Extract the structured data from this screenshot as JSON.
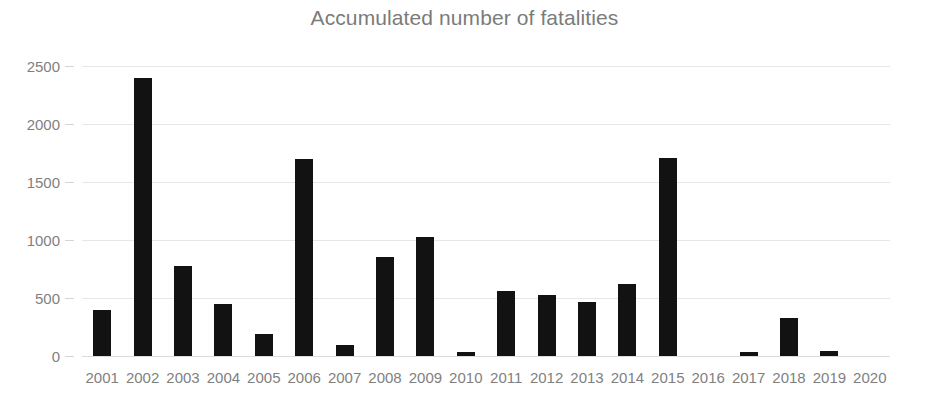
{
  "chart_data": {
    "type": "bar",
    "title": "Accumulated number of fatalities",
    "xlabel": "",
    "ylabel": "",
    "categories": [
      "2001",
      "2002",
      "2003",
      "2004",
      "2005",
      "2006",
      "2007",
      "2008",
      "2009",
      "2010",
      "2011",
      "2012",
      "2013",
      "2014",
      "2015",
      "2016",
      "2017",
      "2018",
      "2019",
      "2020"
    ],
    "values": [
      400,
      2400,
      780,
      450,
      190,
      1700,
      95,
      850,
      1030,
      35,
      560,
      525,
      465,
      620,
      1710,
      0,
      35,
      330,
      40,
      0
    ],
    "series": [
      {
        "name": "Accumulated number of fatalities",
        "values": [
          400,
          2400,
          780,
          450,
          190,
          1700,
          95,
          850,
          1030,
          35,
          560,
          525,
          465,
          620,
          1710,
          0,
          35,
          330,
          40,
          0
        ]
      }
    ],
    "ylim": [
      0,
      2500
    ],
    "y_ticks": [
      0,
      500,
      1000,
      1500,
      2000,
      2500
    ],
    "y_tick_labels": [
      "0",
      "500",
      "1000",
      "1500",
      "2000",
      "2500"
    ],
    "grid": true,
    "grid_axis": "y",
    "legend": false,
    "legend_position": "none",
    "bar_color": "#121212",
    "grid_color": "#e6e6e6",
    "text_color": "#7f7f7f",
    "title_color": "#7b7b7b",
    "background_color": "#ffffff"
  }
}
